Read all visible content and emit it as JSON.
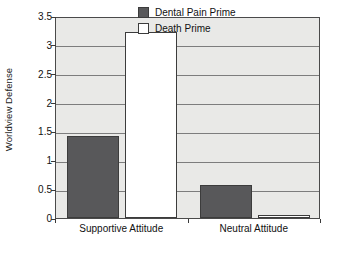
{
  "chart_data": {
    "type": "bar",
    "title": "",
    "xlabel": "",
    "ylabel": "Worldview Defense",
    "ylim": [
      0,
      3.5
    ],
    "yticks": [
      "0",
      "0.5",
      "1",
      "1.5",
      "2",
      "2.5",
      "3",
      "3.5"
    ],
    "ytick_values": [
      0,
      0.5,
      1,
      1.5,
      2,
      2.5,
      3,
      3.5
    ],
    "grid": true,
    "legend_position": "top-right-inside",
    "categories": [
      "Supportive Attitude",
      "Neutral Attitude"
    ],
    "series": [
      {
        "name": "Dental Pain Prime",
        "color": "#58585a",
        "values": [
          1.42,
          0.57
        ]
      },
      {
        "name": "Death Prime",
        "color": "#ffffff",
        "values": [
          3.22,
          0.05
        ]
      }
    ]
  },
  "legend": {
    "entries": [
      {
        "label": "Dental Pain Prime",
        "swatch": "dark"
      },
      {
        "label": "Death Prime",
        "swatch": "light"
      }
    ]
  },
  "colors": {
    "plot_background": "#e9e9e7",
    "frame": "#4a4a4a",
    "gridline": "#7d7d7d",
    "bar_dark": "#58585a",
    "bar_light": "#ffffff",
    "text": "#111111"
  }
}
